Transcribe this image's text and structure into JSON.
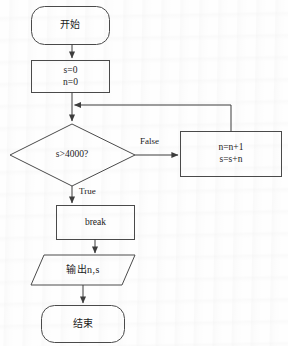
{
  "diagram": {
    "type": "flowchart",
    "title": "",
    "stroke_color": "#4a4a4a",
    "text_color": "#1b1b1b",
    "background_color": "#fefefe",
    "nodes": [
      {
        "id": "start",
        "shape": "terminator",
        "label": "开始"
      },
      {
        "id": "init",
        "shape": "process",
        "lines": [
          "s=0",
          "n=0"
        ]
      },
      {
        "id": "decision",
        "shape": "decision",
        "label": "s>4000?"
      },
      {
        "id": "update",
        "shape": "process",
        "lines": [
          "n=n+1",
          "s=s+n"
        ]
      },
      {
        "id": "break",
        "shape": "process",
        "label": "break"
      },
      {
        "id": "output",
        "shape": "parallelogram",
        "label": "输出n,s"
      },
      {
        "id": "end",
        "shape": "terminator",
        "label": "结束"
      }
    ],
    "edges": [
      {
        "from": "start",
        "to": "init",
        "label": ""
      },
      {
        "from": "init",
        "to": "decision",
        "label": ""
      },
      {
        "from": "decision",
        "to": "update",
        "label": "False"
      },
      {
        "from": "decision",
        "to": "break",
        "label": "True"
      },
      {
        "from": "update",
        "to": "init",
        "label": ""
      },
      {
        "from": "break",
        "to": "output",
        "label": ""
      },
      {
        "from": "output",
        "to": "end",
        "label": ""
      }
    ],
    "edge_labels": {
      "false": "False",
      "true": "True"
    }
  }
}
